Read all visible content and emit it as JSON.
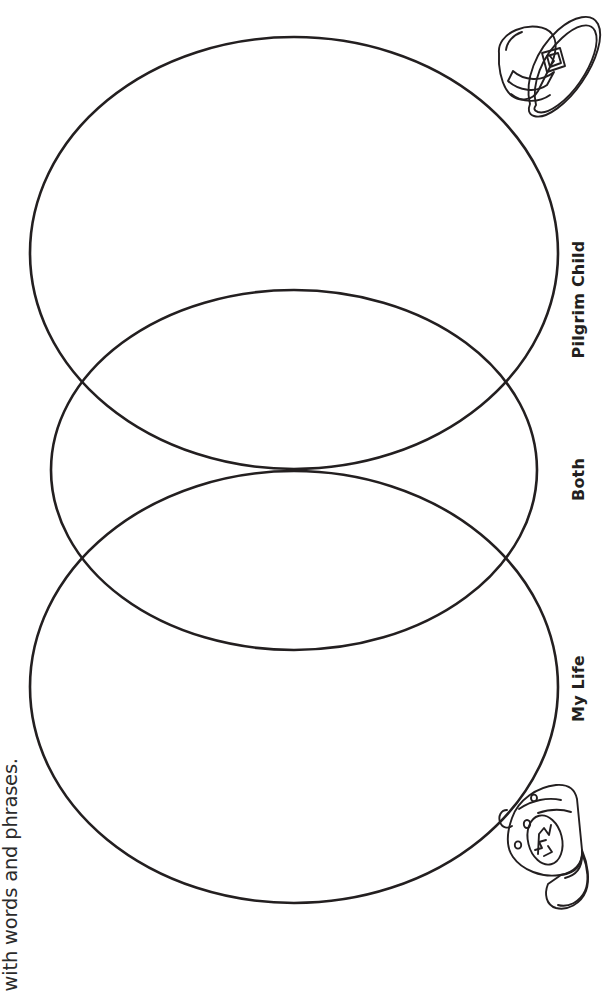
{
  "worksheet": {
    "instruction": "with words and phrases.",
    "labels": {
      "left_circle": "Pilgrim Child",
      "overlap": "Both",
      "right_circle": "My Life"
    },
    "illustrations": {
      "top_right": "pilgrim-hat-illustration",
      "bottom_right": "baseball-cap-illustration"
    },
    "colors": {
      "stroke": "#231f20",
      "background": "#ffffff",
      "text": "#231f20"
    },
    "diagram": {
      "type": "venn",
      "circle_count": 3,
      "orientation": "rotated-90-landscape"
    }
  }
}
